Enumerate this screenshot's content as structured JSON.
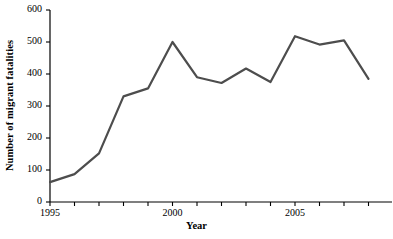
{
  "chart_data": {
    "type": "line",
    "title": "",
    "xlabel": "Year",
    "ylabel": "Number of migrant fatalities",
    "x": [
      1995,
      1996,
      1997,
      1998,
      1999,
      2000,
      2001,
      2002,
      2003,
      2004,
      2005,
      2006,
      2007,
      2008
    ],
    "values": [
      62,
      87,
      152,
      330,
      355,
      500,
      390,
      372,
      417,
      375,
      518,
      492,
      505,
      385
    ],
    "series": [
      {
        "name": "Migrant fatalities",
        "values": [
          62,
          87,
          152,
          330,
          355,
          500,
          390,
          372,
          417,
          375,
          518,
          492,
          505,
          385
        ]
      }
    ],
    "xlim": [
      1995,
      2008
    ],
    "ylim": [
      0,
      600
    ],
    "ytick_values": [
      0,
      100,
      200,
      300,
      400,
      500,
      600
    ],
    "ytick_labels": [
      "0",
      "100",
      "200",
      "300",
      "400",
      "500",
      "600"
    ],
    "xtick_values": [
      1995,
      1996,
      1997,
      1998,
      1999,
      2000,
      2001,
      2002,
      2003,
      2004,
      2005,
      2006,
      2007,
      2008
    ],
    "xtick_labels_shown": [
      {
        "value": 1995,
        "label": "1995"
      },
      {
        "value": 2000,
        "label": "2000"
      },
      {
        "value": 2005,
        "label": "2005"
      }
    ],
    "grid": false,
    "legend": null,
    "line_color": "#4d4d4d",
    "axis_color": "#000000",
    "background_color": "#ffffff",
    "line_width": 2.2,
    "markers": false
  }
}
